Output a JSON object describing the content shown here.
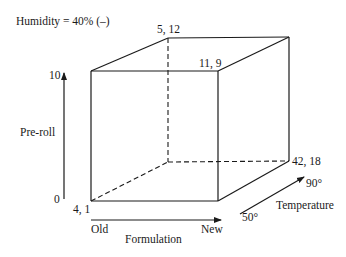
{
  "title": "Humidity = 40% (–)",
  "axes": {
    "preroll": {
      "label": "Pre-roll",
      "min_label": "0",
      "max_label": "10"
    },
    "formulation": {
      "label": "Formulation",
      "min_label": "Old",
      "max_label": "New"
    },
    "temperature": {
      "label": "Temperature",
      "min_label": "50°",
      "max_label": "90°"
    }
  },
  "vertices": {
    "front_bottom_left": "4, 1",
    "back_top_left": "5, 12",
    "front_top_right": "11, 9",
    "back_bottom_right": "42, 18"
  },
  "colors": {
    "line": "#1a1a1a",
    "background": "#ffffff"
  }
}
